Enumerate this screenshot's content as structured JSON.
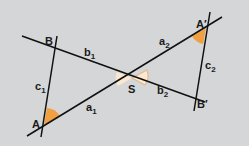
{
  "figure": {
    "background": "#d4d6d8",
    "line_color": "#111111",
    "angle_fill_orange": "#f0a040",
    "angle_fill_light": "#fbe9cf",
    "points": {
      "A": "A",
      "B": "B",
      "S": "S",
      "A_prime": "A′",
      "B_prime": "B′"
    },
    "segments": {
      "a1": {
        "base": "a",
        "sub": "1"
      },
      "b1": {
        "base": "b",
        "sub": "1"
      },
      "c1": {
        "base": "c",
        "sub": "1"
      },
      "a2": {
        "base": "a",
        "sub": "2"
      },
      "b2": {
        "base": "b",
        "sub": "2"
      },
      "c2": {
        "base": "c",
        "sub": "2"
      }
    }
  }
}
